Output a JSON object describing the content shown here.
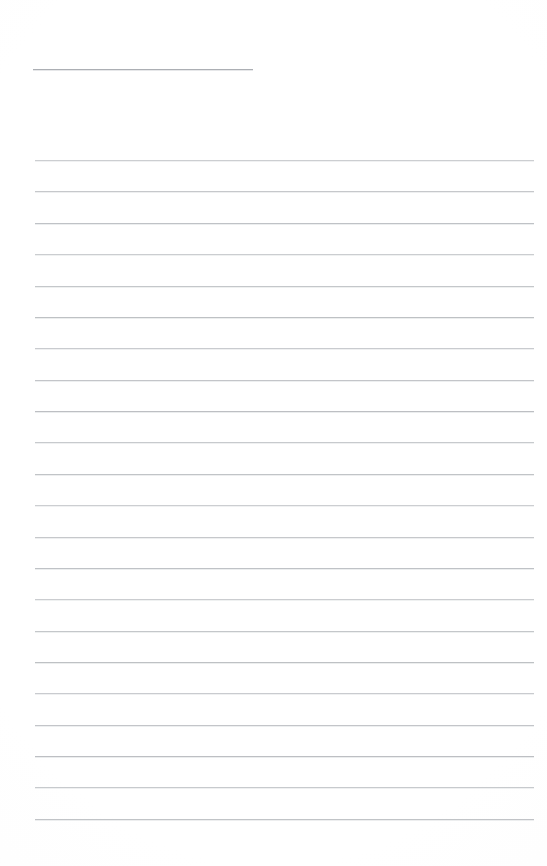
{
  "document": {
    "kind": "lined-paper-sheet",
    "page_width": 547,
    "page_height": 866,
    "background_color": "#fefefe",
    "rule_color": "#b9bcc0",
    "title_rule_color": "#9ea2a7",
    "text_content": "",
    "annotations": [],
    "title_rule": {
      "label": "title-rule",
      "x": 33,
      "y": 69,
      "width": 220
    },
    "body_rules": {
      "label": "body-rules",
      "x": 35,
      "width": 499,
      "first_y": 160,
      "spacing": 31.3,
      "count": 22,
      "y_positions": [
        160,
        191,
        223,
        254,
        286,
        317,
        348,
        380,
        411,
        442,
        474,
        505,
        537,
        568,
        599,
        631,
        662,
        693,
        725,
        756,
        787,
        819
      ]
    }
  }
}
